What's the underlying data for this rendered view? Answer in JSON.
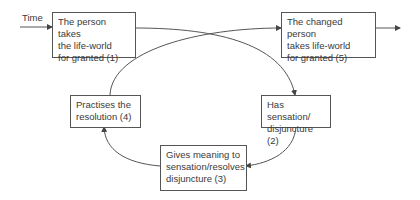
{
  "diagram": {
    "time_label": "Time",
    "nodes": [
      {
        "id": "1",
        "text": "The person takes\nthe life-world\nfor granted (1)"
      },
      {
        "id": "2",
        "text": "Has sensation/\ndisjuncture (2)"
      },
      {
        "id": "3",
        "text": "Gives meaning to\nsensation/resolves\ndisjuncture (3)"
      },
      {
        "id": "4",
        "text": "Practises the\nresolution (4)"
      },
      {
        "id": "5",
        "text": "The changed person\ntakes life-world\nfor granted (5)"
      }
    ],
    "edges": [
      {
        "from": "time",
        "to": "1"
      },
      {
        "from": "1",
        "to": "2"
      },
      {
        "from": "2",
        "to": "3"
      },
      {
        "from": "3",
        "to": "4"
      },
      {
        "from": "4",
        "to": "5"
      },
      {
        "from": "5",
        "to": "out"
      }
    ],
    "colors": {
      "line": "#555555",
      "text": "#3a3a3a",
      "background": "#ffffff"
    }
  }
}
